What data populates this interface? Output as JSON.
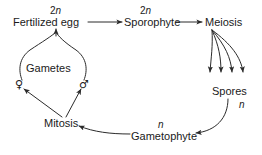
{
  "diagram": {
    "background_color": "#ffffff",
    "line_color": "#2b2b2b",
    "text_color": "#1a1a1a",
    "nodes": {
      "fertilized_egg": "Fertilized egg",
      "sporophyte": "Sporophyte",
      "meiosis": "Meiosis",
      "spores": "Spores",
      "gametophyte": "Gametophyte",
      "mitosis": "Mitosis",
      "gametes": "Gametes"
    },
    "ploidy_labels": {
      "fertilized_egg": {
        "prefix": "2",
        "italic": "n"
      },
      "sporophyte": {
        "prefix": "2",
        "italic": "n"
      },
      "spores": {
        "prefix": "",
        "italic": "n"
      },
      "gametophyte": {
        "prefix": "",
        "italic": "n"
      }
    },
    "symbols": {
      "female": "♀",
      "male": "♂"
    },
    "edges": [
      {
        "from": "Fertilized egg",
        "to": "Sporophyte",
        "style": "straight-arrow"
      },
      {
        "from": "Sporophyte",
        "to": "Meiosis",
        "style": "straight-arrow"
      },
      {
        "from": "Meiosis",
        "to": "Spores",
        "style": "fanned-curved-arrows",
        "count": 4
      },
      {
        "from": "Spores",
        "to": "Gametophyte",
        "style": "curved-arrow"
      },
      {
        "from": "Gametophyte",
        "to": "Mitosis",
        "style": "curved-arrow"
      },
      {
        "from": "Mitosis",
        "to": "female gamete",
        "style": "straight-arrow"
      },
      {
        "from": "Mitosis",
        "to": "male gamete",
        "style": "straight-arrow"
      },
      {
        "from": "Gametes",
        "to": "Fertilized egg",
        "style": "merging-curved-arrow"
      }
    ]
  }
}
